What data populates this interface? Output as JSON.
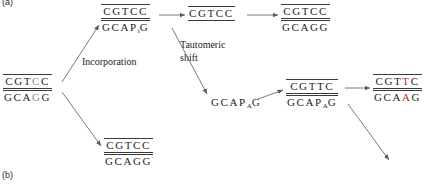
{
  "figure": {
    "panel_a_label": "(a)",
    "panel_b_label": "(b)",
    "colors": {
      "mutation_red": "#b03020",
      "line": "#3a3a3a",
      "text": "#1c1c1c",
      "background": "#ffffff"
    }
  },
  "captions": {
    "incorporation": "Incorporation",
    "tautomeric_line1": "Tautomeric",
    "tautomeric_line2": "shift"
  },
  "duplexes": {
    "parent": {
      "name": "parent-duplex",
      "top": [
        "C",
        "G",
        "T",
        "C",
        "C"
      ],
      "bottom": [
        "G",
        "C",
        "A",
        "G",
        "G"
      ],
      "top_highlight_index": 3,
      "bottom_highlight_index": 3
    },
    "incorporated": {
      "name": "incorporated-duplex",
      "top": [
        "C",
        "G",
        "T",
        "C",
        "C"
      ],
      "bottom": [
        "G",
        "C",
        "A",
        "P",
        "G"
      ],
      "bottom_subscript_index": 3,
      "bottom_subscript": "i"
    },
    "replicated": {
      "name": "replicated-duplex",
      "top": [
        "C",
        "G",
        "T",
        "C",
        "C"
      ],
      "bottom": []
    },
    "restored": {
      "name": "restored-duplex",
      "top": [
        "C",
        "G",
        "T",
        "C",
        "C"
      ],
      "bottom": [
        "G",
        "C",
        "A",
        "G",
        "G"
      ]
    },
    "unchanged": {
      "name": "unchanged-duplex",
      "top": [
        "C",
        "G",
        "T",
        "C",
        "C"
      ],
      "bottom": [
        "G",
        "C",
        "A",
        "G",
        "G"
      ]
    },
    "shifted": {
      "name": "tautomer-shifted-strand",
      "top": [],
      "bottom": [
        "G",
        "C",
        "A",
        "P",
        "G"
      ],
      "bottom_subscript_index": 3,
      "bottom_subscript": "A"
    },
    "mismatch": {
      "name": "mismatched-duplex",
      "top": [
        "C",
        "G",
        "T",
        "T",
        "C"
      ],
      "bottom": [
        "G",
        "C",
        "A",
        "P",
        "G"
      ],
      "bottom_subscript_index": 3,
      "bottom_subscript": "A"
    },
    "mutant": {
      "name": "mutant-duplex",
      "top": [
        "C",
        "G",
        "T",
        "T",
        "C"
      ],
      "bottom": [
        "G",
        "C",
        "A",
        "A",
        "G"
      ],
      "top_mutation_index": 3,
      "bottom_mutation_index": 3
    }
  }
}
